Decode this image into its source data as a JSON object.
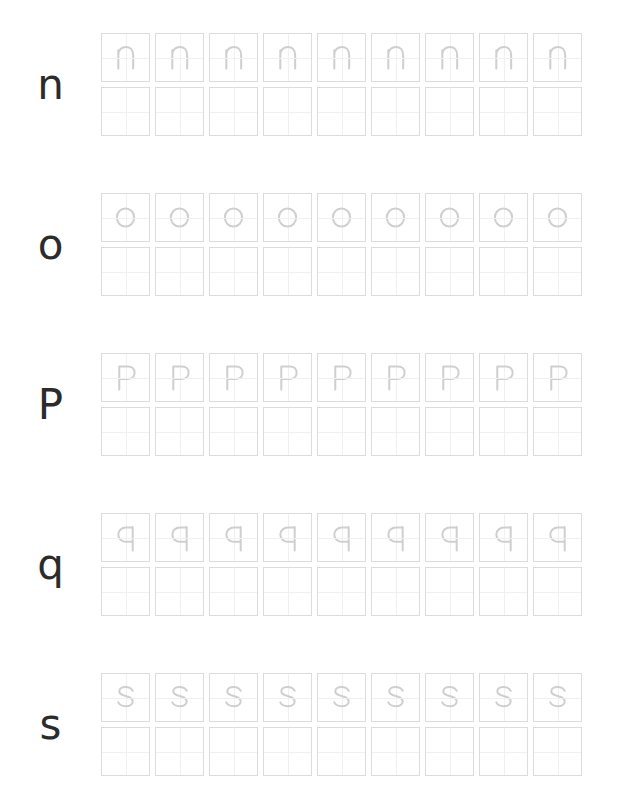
{
  "page": {
    "type": "handwriting-tracing-worksheet",
    "background_color": "#ffffff",
    "cell_border_color": "#dcdcdc",
    "guide_line_color": "#f0f0f0",
    "trace_letter_color": "#cfcfcf",
    "label_letter_color": "#2b2b2b",
    "columns_per_row": 9,
    "rows_per_letter": 2,
    "trace_row_index": 0,
    "blank_row_index": 1
  },
  "letters": [
    {
      "label": "n",
      "case": "lowercase",
      "trace_count": 9,
      "blank_count": 9,
      "glyph": "n"
    },
    {
      "label": "o",
      "case": "lowercase",
      "trace_count": 9,
      "blank_count": 9,
      "glyph": "o"
    },
    {
      "label": "P",
      "case": "uppercase",
      "trace_count": 9,
      "blank_count": 9,
      "glyph": "P"
    },
    {
      "label": "q",
      "case": "lowercase",
      "trace_count": 9,
      "blank_count": 9,
      "glyph": "q"
    },
    {
      "label": "s",
      "case": "lowercase",
      "trace_count": 9,
      "blank_count": 9,
      "glyph": "s"
    }
  ],
  "glyph_paths": {
    "n": "M 17 17 L 17 36 M 17 22 C 17 16 21 13.5 25 13.5 C 29 13.5 32.5 16 32.5 22 L 32.5 36",
    "o": "M 24.5 15 C 29.5 15 33.5 19 33.5 24.5 C 33.5 30 29.5 34 24.5 34 C 19.5 34 15.5 30 15.5 24.5 C 15.5 19 19.5 15 24.5 15 Z",
    "P": "M 18 13 L 18 37 M 18 13 L 27 13 C 31.5 13 34 16 34 19.5 C 34 23 31.5 26 27 26 L 18 26",
    "q": "M 32 13.5 L 32 38 M 32 14 L 25 14 C 20.5 14 17 17.5 17 21.5 C 17 25.5 20.5 29 25 29 L 32 29",
    "s": "M 32 17.5 C 30.5 14.8 27.5 13.6 24.5 13.6 C 21 13.6 18 15.3 18 18.2 C 18 24.2 32 21.5 32 28.5 C 32 31.6 28.8 33.6 24.8 33.6 C 21.5 33.6 18.4 32.3 17 29.6"
  },
  "layout": {
    "block_tops": [
      33,
      193,
      353,
      513,
      673
    ],
    "grid_left": 101,
    "cell_size": 49,
    "cell_gap": 5
  }
}
